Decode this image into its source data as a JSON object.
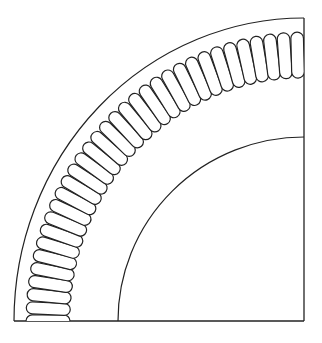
{
  "diagram": {
    "type": "quarter-section line drawing",
    "colors": {
      "stroke": "#222222",
      "background": "#ffffff"
    },
    "geometry": {
      "center": [
        304,
        321
      ],
      "outer_arc_rx": 290,
      "outer_arc_ry": 303,
      "coil_outer_rx": 278,
      "coil_outer_ry": 289,
      "coil_inner_rx": 234,
      "coil_inner_ry": 243,
      "inner_arc_rx": 186,
      "inner_arc_ry": 184,
      "coil_count": 33
    },
    "parts": [
      {
        "name": "outer-boundary-arc"
      },
      {
        "name": "coil-winding-ring"
      },
      {
        "name": "inner-boundary-arc"
      },
      {
        "name": "right-edge-line"
      },
      {
        "name": "bottom-edge-line"
      }
    ]
  }
}
